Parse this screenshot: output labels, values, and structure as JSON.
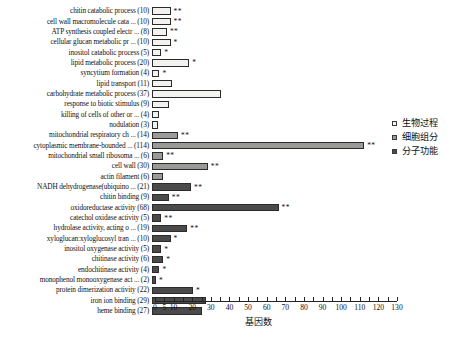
{
  "chart_data": {
    "type": "bar",
    "orientation": "horizontal",
    "title": "",
    "xlabel": "基因数",
    "ylabel": "",
    "xlim": [
      0,
      130
    ],
    "grid": false,
    "legend_position": "right",
    "tick_values": [
      0,
      5,
      10,
      20,
      30,
      40,
      50,
      60,
      70,
      80,
      90,
      100,
      110,
      120,
      130
    ],
    "tick_labels": [
      "0",
      "5",
      "10",
      "20",
      "30",
      "40",
      "50",
      "60",
      "70",
      "80",
      "90",
      "100",
      "110",
      "120",
      "130"
    ],
    "minor_tick_values": [
      15,
      25,
      35,
      45,
      55,
      65,
      75,
      85,
      95,
      105,
      115,
      125
    ],
    "legend": [
      {
        "label": "生物过程",
        "group": "biological_process",
        "color": "#f2f2f0"
      },
      {
        "label": "细胞组分",
        "group": "cellular_component",
        "color": "#9a9a98"
      },
      {
        "label": "分子功能",
        "group": "molecular_function",
        "color": "#4a4a4a"
      }
    ],
    "categories": [
      "chitin catabolic process (10)",
      "cell wall macromolecule cata ... (10)",
      "ATP synthesis coupled electr ... (8)",
      "cellular glucan metabolic pr ... (10)",
      "inositol catabolic process (5)",
      "lipid metabolic process (20)",
      "syncytium formation (4)",
      "lipid transport (11)",
      "carbohydrate metabolic process (37)",
      "response to biotic stimulus (9)",
      "killing of cells of other or ... (4)",
      "nodulation (3)",
      "mitochondrial respiratory ch ... (14)",
      "cytoplasmic membrane-bounded ... (114)",
      "mitochondrial small ribosoma ... (6)",
      "cell wall (30)",
      "actin filament (6)",
      "NADH dehydrogenase(ubiquino ... (21)",
      "chitin binding (9)",
      "oxidoreductase activity (68)",
      "catechol oxidase activity (5)",
      "hydrolase activity, acting o ... (19)",
      "xyloglucan:xyloglucosyl tran ... (10)",
      "inositol oxygenase activity (5)",
      "chitinase activity (6)",
      "endochitinase activity (4)",
      "monophenol monooxygenase act ... (2)",
      "protein dimerization activity (22)",
      "iron ion binding (29)",
      "heme binding (27)"
    ],
    "values": [
      10,
      10,
      8,
      10,
      5,
      20,
      4,
      11,
      37,
      9,
      4,
      3,
      14,
      114,
      6,
      30,
      6,
      21,
      9,
      68,
      5,
      19,
      10,
      5,
      6,
      4,
      2,
      22,
      29,
      27
    ],
    "groups": [
      "biological_process",
      "biological_process",
      "biological_process",
      "biological_process",
      "biological_process",
      "biological_process",
      "biological_process",
      "biological_process",
      "biological_process",
      "biological_process",
      "biological_process",
      "biological_process",
      "cellular_component",
      "cellular_component",
      "cellular_component",
      "cellular_component",
      "cellular_component",
      "molecular_function",
      "molecular_function",
      "molecular_function",
      "molecular_function",
      "molecular_function",
      "molecular_function",
      "molecular_function",
      "molecular_function",
      "molecular_function",
      "molecular_function",
      "molecular_function",
      "molecular_function",
      "molecular_function"
    ],
    "significance": [
      "**",
      "**",
      "**",
      "*",
      "*",
      "*",
      "*",
      "",
      "",
      "",
      "",
      "",
      "**",
      "**",
      "**",
      "**",
      "",
      "**",
      "**",
      "**",
      "**",
      "**",
      "*",
      "*",
      "*",
      "*",
      "*",
      "*",
      "",
      ""
    ]
  }
}
